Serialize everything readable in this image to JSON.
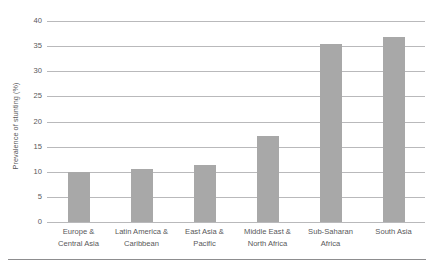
{
  "chart_data": {
    "type": "bar",
    "title": "",
    "subtitle": "",
    "xlabel": "",
    "ylabel": "Prevalence of stunting (%)",
    "ylim": [
      0,
      40
    ],
    "ytick_labels": [
      "40",
      "35",
      "30",
      "25",
      "20",
      "15",
      "10",
      "5",
      "0"
    ],
    "yticks": [
      40,
      35,
      30,
      25,
      20,
      15,
      10,
      5,
      0
    ],
    "grid": true,
    "legend": null,
    "legend_position": "none",
    "bar_color": "#a8a8a8",
    "gridline_color": "#b9b9bb",
    "text_color": "#58585a",
    "categories": [
      "Europe & Central Asia",
      "Latin America & Caribbean",
      "East Asia & Pacific",
      "Middle East & North Africa",
      "Sub-Saharan Africa",
      "South Asia"
    ],
    "category_lines": [
      [
        "Europe &",
        "Central Asia"
      ],
      [
        "Latin America &",
        "Caribbean"
      ],
      [
        "East Asia &",
        "Pacific"
      ],
      [
        "Middle East &",
        "North Africa"
      ],
      [
        "Sub-Saharan",
        "Africa"
      ],
      [
        "South Asia",
        ""
      ]
    ],
    "values": [
      10.0,
      10.6,
      11.3,
      17.2,
      35.5,
      36.8
    ]
  }
}
